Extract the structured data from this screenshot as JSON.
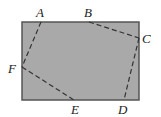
{
  "diagram": {
    "type": "geometry",
    "rectangle": {
      "x": 22,
      "y": 22,
      "width": 117,
      "height": 78,
      "fill": "#a9a9a9",
      "stroke": "#555555"
    },
    "dash_color": "#333333",
    "points": [
      {
        "label": "A",
        "x": 41,
        "y": 22,
        "lx": 36,
        "ly": 16
      },
      {
        "label": "B",
        "x": 89,
        "y": 22,
        "lx": 84,
        "ly": 16
      },
      {
        "label": "C",
        "x": 139,
        "y": 38,
        "lx": 142,
        "ly": 43
      },
      {
        "label": "D",
        "x": 124,
        "y": 100,
        "lx": 118,
        "ly": 113
      },
      {
        "label": "E",
        "x": 74,
        "y": 100,
        "lx": 71,
        "ly": 113
      },
      {
        "label": "F",
        "x": 22,
        "y": 67,
        "lx": 8,
        "ly": 72
      }
    ],
    "dashed_segments": [
      [
        "A",
        "F"
      ],
      [
        "F",
        "E"
      ],
      [
        "B",
        "C"
      ],
      [
        "C",
        "D"
      ]
    ]
  }
}
